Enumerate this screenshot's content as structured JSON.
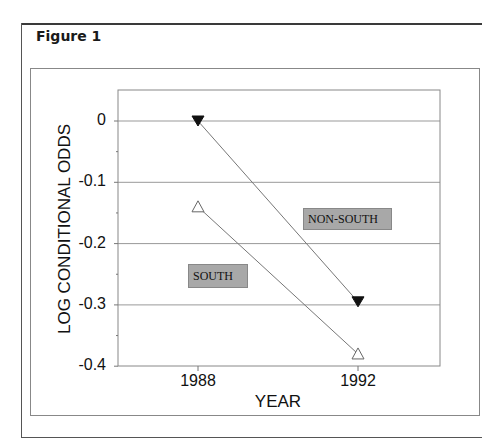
{
  "figure": {
    "title": "Figure 1"
  },
  "chart_data": {
    "type": "line",
    "title": "",
    "xlabel": "YEAR",
    "ylabel": "LOG CONDITIONAL ODDS",
    "categories": [
      "1988",
      "1992"
    ],
    "x": [
      1988,
      1992
    ],
    "ylim": [
      -0.4,
      0.05
    ],
    "yticks": [
      "0",
      "-0.1",
      "-0.2",
      "-0.3",
      "-0.4"
    ],
    "ytick_values": [
      0,
      -0.1,
      -0.2,
      -0.3,
      -0.4
    ],
    "grid": "horizontal",
    "legend_position": "inline labels",
    "series": [
      {
        "name": "NON-SOUTH",
        "marker": "filled-down-triangle",
        "values": [
          0.0,
          -0.295
        ]
      },
      {
        "name": "SOUTH",
        "marker": "open-up-triangle",
        "values": [
          -0.14,
          -0.38
        ]
      }
    ]
  },
  "labels": {
    "non_south": "NON-SOUTH",
    "south": "SOUTH"
  }
}
